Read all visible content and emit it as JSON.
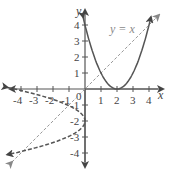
{
  "chart_data": {
    "type": "line",
    "title": "",
    "xlabel": "x",
    "ylabel": "y",
    "xlim": [
      -4.6,
      4.6
    ],
    "ylim": [
      -4.8,
      5.0
    ],
    "grid": false,
    "legend": "none",
    "x_ticks": [
      -4,
      -3,
      -2,
      -1,
      1,
      2,
      3,
      4
    ],
    "y_ticks": [
      -4,
      -3,
      -2,
      -1,
      1,
      2,
      3,
      4
    ],
    "origin_label": "0",
    "series": [
      {
        "name": "y = (x - 2)^2",
        "style": "solid",
        "color": "#555555",
        "function": "y=(x-2)^2",
        "x": [
          0,
          0.5,
          1,
          1.5,
          2,
          2.5,
          3,
          3.5,
          4
        ],
        "y": [
          4,
          2.25,
          1,
          0.25,
          0,
          0.25,
          1,
          2.25,
          4
        ]
      },
      {
        "name": "y = x",
        "style": "dashed",
        "color": "#9a9a9a",
        "function": "y=x",
        "x": [
          -4.5,
          4.5
        ],
        "y": [
          -4.5,
          4.5
        ]
      },
      {
        "name": "inverse x = (y - 2)^2 reflected",
        "style": "dashed",
        "color": "#555555",
        "function": "x=-(y+2)^2 ... reflection",
        "x": [
          -4.4,
          -4,
          -2.25,
          -1,
          -0.25,
          0,
          -0.25,
          -1,
          -2.25,
          -4
        ],
        "y": [
          0.1,
          0,
          -0.5,
          -1,
          -1.5,
          -2,
          -2.5,
          -3,
          -3.5,
          -4
        ]
      }
    ],
    "annotations": [
      {
        "text": "y = x",
        "x": 1.6,
        "y": 3.8
      }
    ],
    "labels": {
      "x_axis": "x",
      "y_axis": "y",
      "tick_x": [
        "-4",
        "-3",
        "-2",
        "-1",
        "1",
        "2",
        "3",
        "4"
      ],
      "tick_y": [
        "4",
        "3",
        "2",
        "1",
        "-1",
        "-2",
        "-3",
        "-4"
      ],
      "origin": "0",
      "annotation_line": "y = x"
    }
  }
}
